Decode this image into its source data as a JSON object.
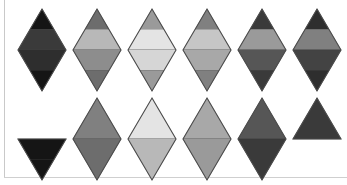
{
  "figure": {
    "width": 347,
    "height": 185,
    "background_color": "#ffffff",
    "rule_color": "#c9c9c9",
    "outline_color": "#4a4a4a",
    "columns": 6,
    "rows": 2
  },
  "palette": {
    "near_black": "#151515",
    "very_dark": "#242424",
    "dark": "#2e2e2e",
    "dark_gray": "#3a3a3a",
    "charcoal": "#434343",
    "mid_dark_gray": "#565656",
    "gray": "#6d6d6d",
    "mid_gray": "#808080",
    "warm_gray": "#8d8d8d",
    "light_mid_gray": "#9a9a9a",
    "light_gray": "#a8a8a8",
    "pale_gray": "#b8b8b8",
    "paler_gray": "#c6c6c6",
    "very_pale_gray": "#d6d6d6",
    "near_white_gray": "#e4e4e4",
    "white": "#ffffff"
  },
  "chart_data": {
    "type": "table",
    "xlabel": "",
    "ylabel": "",
    "columns": [
      "1",
      "2",
      "3",
      "4",
      "5",
      "6"
    ],
    "row_labels": [
      "top-row",
      "bottom-row"
    ],
    "band_fractions": [
      0.0,
      0.25,
      0.5,
      0.75,
      1.0
    ],
    "shapes": [
      {
        "id": "shape-r1-c1",
        "row": 0,
        "col": 0,
        "form": "diamond",
        "has_top": true,
        "has_bottom": true,
        "band_count": 4,
        "bands": [
          "#151515",
          "#3a3a3a",
          "#2e2e2e",
          "#151515"
        ],
        "mean_luminance": 0.14
      },
      {
        "id": "shape-r1-c2",
        "row": 0,
        "col": 1,
        "form": "diamond",
        "has_top": true,
        "has_bottom": true,
        "band_count": 4,
        "bands": [
          "#6d6d6d",
          "#b8b8b8",
          "#8d8d8d",
          "#6d6d6d"
        ],
        "mean_luminance": 0.52
      },
      {
        "id": "shape-r1-c3",
        "row": 0,
        "col": 2,
        "form": "diamond",
        "has_top": true,
        "has_bottom": true,
        "band_count": 4,
        "bands": [
          "#9a9a9a",
          "#e4e4e4",
          "#d6d6d6",
          "#9a9a9a"
        ],
        "mean_luminance": 0.74
      },
      {
        "id": "shape-r1-c4",
        "row": 0,
        "col": 3,
        "form": "diamond",
        "has_top": true,
        "has_bottom": true,
        "band_count": 4,
        "bands": [
          "#808080",
          "#c6c6c6",
          "#a8a8a8",
          "#808080"
        ],
        "mean_luminance": 0.62
      },
      {
        "id": "shape-r1-c5",
        "row": 0,
        "col": 4,
        "form": "diamond",
        "has_top": true,
        "has_bottom": true,
        "band_count": 4,
        "bands": [
          "#3a3a3a",
          "#9a9a9a",
          "#565656",
          "#3a3a3a"
        ],
        "mean_luminance": 0.33
      },
      {
        "id": "shape-r1-c6",
        "row": 0,
        "col": 5,
        "form": "diamond",
        "has_top": true,
        "has_bottom": true,
        "band_count": 4,
        "bands": [
          "#2e2e2e",
          "#808080",
          "#434343",
          "#2e2e2e"
        ],
        "mean_luminance": 0.27
      },
      {
        "id": "shape-r2-c1",
        "row": 1,
        "col": 0,
        "form": "down-triangle",
        "has_top": false,
        "has_bottom": true,
        "band_count": 2,
        "bands": [
          "#151515",
          "#151515"
        ],
        "mean_luminance": 0.08
      },
      {
        "id": "shape-r2-c2",
        "row": 1,
        "col": 1,
        "form": "diamond",
        "has_top": true,
        "has_bottom": true,
        "band_count": 2,
        "bands": [
          "#808080",
          "#6d6d6d"
        ],
        "mean_luminance": 0.47
      },
      {
        "id": "shape-r2-c3",
        "row": 1,
        "col": 2,
        "form": "diamond",
        "has_top": true,
        "has_bottom": true,
        "band_count": 2,
        "bands": [
          "#e4e4e4",
          "#b8b8b8"
        ],
        "mean_luminance": 0.79
      },
      {
        "id": "shape-r2-c4",
        "row": 1,
        "col": 3,
        "form": "diamond",
        "has_top": true,
        "has_bottom": true,
        "band_count": 2,
        "bands": [
          "#a8a8a8",
          "#9a9a9a"
        ],
        "mean_luminance": 0.64
      },
      {
        "id": "shape-r2-c5",
        "row": 1,
        "col": 4,
        "form": "diamond",
        "has_top": true,
        "has_bottom": true,
        "band_count": 2,
        "bands": [
          "#565656",
          "#3a3a3a"
        ],
        "mean_luminance": 0.28
      },
      {
        "id": "shape-r2-c6",
        "row": 1,
        "col": 5,
        "form": "up-triangle",
        "has_top": true,
        "has_bottom": false,
        "band_count": 1,
        "bands": [
          "#3a3a3a"
        ],
        "mean_luminance": 0.23
      }
    ],
    "layout": {
      "col_x": [
        13,
        68,
        123,
        178,
        233,
        288
      ],
      "row_y": [
        6,
        95
      ],
      "cell_width": 58,
      "cell_height": 88,
      "grid": false,
      "legend": "none"
    }
  }
}
